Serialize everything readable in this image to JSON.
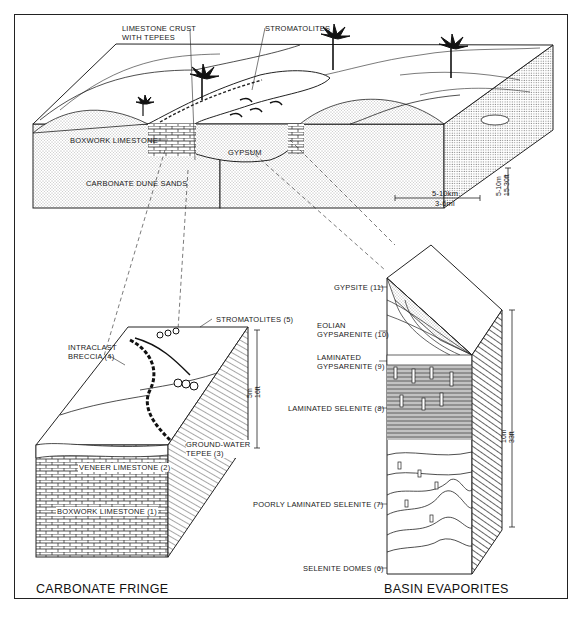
{
  "figure": {
    "type": "geologic block diagram",
    "top_block": {
      "labels": {
        "limestone_crust": "LIMESTONE CRUST\nWITH TEPEES",
        "limestone_crust_line1": "LIMESTONE CRUST",
        "limestone_crust_line2": "WITH TEPEES",
        "stromatolites": "STROMATOLITES",
        "boxwork_limestone": "BOXWORK LIMESTONE",
        "gypsum": "GYPSUM",
        "carbonate_dune_sands": "CARBONATE DUNE SANDS"
      },
      "scale": {
        "horizontal_km": "5-10km",
        "horizontal_mi": "3-6mi",
        "vertical_m": "5-10m",
        "vertical_ft": "15-30ft"
      }
    },
    "carbonate_fringe": {
      "title": "CARBONATE FRINGE",
      "labels": {
        "stromatolites": "STROMATOLITES (5)",
        "intraclast_line1": "INTRACLAST",
        "intraclast_line2": "BRECCIA (4)",
        "groundwater_line1": "GROUND-WATER",
        "groundwater_line2": "TEPEE (3)",
        "veneer": "VENEER LIMESTONE (2)",
        "boxwork": "BOXWORK LIMESTONE (1)"
      },
      "scale": {
        "m": "5m",
        "ft": "16ft"
      }
    },
    "basin_evaporites": {
      "title": "BASIN EVAPORITES",
      "labels": {
        "gypsite": "GYPSITE (11)",
        "eolian_line1": "EOLIAN",
        "eolian_line2": "GYPSARENITE (10)",
        "laminated_gyps_line1": "LAMINATED",
        "laminated_gyps_line2": "GYPSARENITE (9)",
        "laminated_selenite": "LAMINATED SELENITE (8)",
        "poorly_laminated": "POORLY LAMINATED SELENITE (7)",
        "selenite_domes": "SELENITE DOMES (6)"
      },
      "scale": {
        "m": "10m",
        "ft": "33ft"
      }
    }
  }
}
